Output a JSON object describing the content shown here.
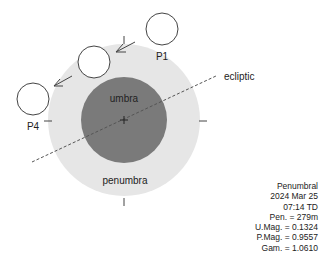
{
  "diagram": {
    "labels": {
      "umbra": "umbra",
      "penumbra": "penumbra",
      "ecliptic": "ecliptic",
      "p1": "P1",
      "p4": "P4"
    },
    "colors": {
      "penumbra": "#e6e6e6",
      "umbra": "#7a7a7a",
      "outline": "#444444",
      "text": "#222222"
    }
  },
  "info": {
    "type": "Penumbral",
    "date": "2024 Mar 25",
    "time": "07:14 TD",
    "pen": "Pen. = 279m",
    "umag": "U.Mag. = 0.1324",
    "pmag": "P.Mag. = 0.9557",
    "gam": "Gam. = 1.0610"
  }
}
